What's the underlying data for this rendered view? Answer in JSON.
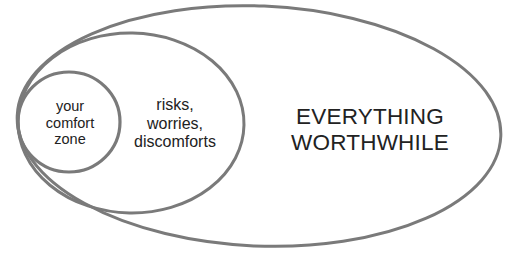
{
  "diagram": {
    "type": "nested-ellipses",
    "regions": [
      {
        "id": "comfort",
        "lines": [
          "your",
          "comfort",
          "zone"
        ]
      },
      {
        "id": "risks",
        "lines": [
          "risks,",
          "worries,",
          "discomforts"
        ]
      },
      {
        "id": "worthwhile",
        "lines": [
          "EVERYTHING",
          "WORTHWHILE"
        ]
      }
    ],
    "colors": {
      "stroke": "#7a7a7a",
      "text": "#222222",
      "background": "#ffffff"
    }
  }
}
